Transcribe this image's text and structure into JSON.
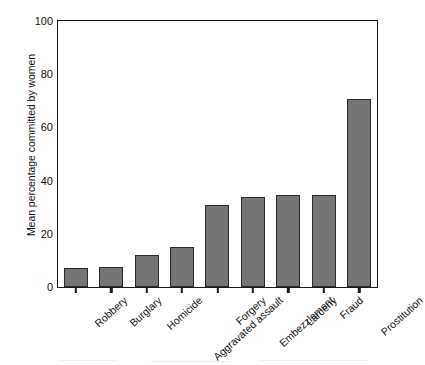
{
  "chart_data": {
    "type": "bar",
    "title": "",
    "xlabel": "",
    "ylabel": "Mean percentage committed by women",
    "categories": [
      "Robbery",
      "Burglary",
      "Homicide",
      "Aggravated assault",
      "Forgery",
      "Embezzlement",
      "Larceny",
      "Fraud",
      "Prostitution"
    ],
    "values": [
      7,
      7.5,
      12,
      15,
      31,
      34,
      34.5,
      34.5,
      70.5
    ],
    "ylim": [
      0,
      100
    ],
    "yticks": [
      0,
      20,
      40,
      60,
      80,
      100
    ],
    "ytick_labels": [
      "0",
      "20",
      "40",
      "60",
      "80",
      "100"
    ],
    "grid": false,
    "legend": null,
    "bar_color": "#757575",
    "bar_edge_color": "#2b2b2b",
    "axis_color": "#1a1a1a",
    "background": "#ffffff"
  }
}
